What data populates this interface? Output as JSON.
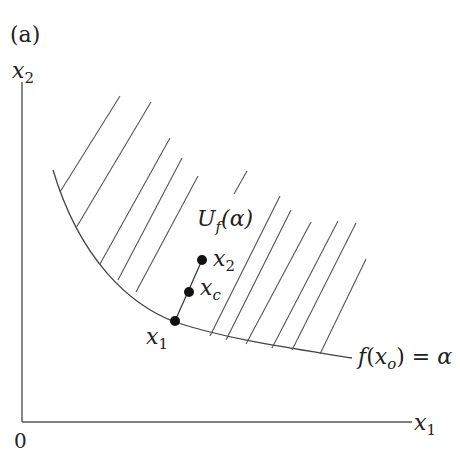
{
  "panel_label": "(a)",
  "axes": {
    "y_label_base": "x",
    "y_label_sub": "2",
    "x_label_base": "x",
    "x_label_sub": "1",
    "origin": "0"
  },
  "region_label": {
    "base": "U",
    "sub": "f",
    "arg": "(α)"
  },
  "curve_label": {
    "f": "f",
    "open": "(",
    "var": "x",
    "sub": "o",
    "close": ")",
    "eq": " = α"
  },
  "points": [
    {
      "id": "x1",
      "base": "x",
      "sub": "1"
    },
    {
      "id": "xc",
      "base": "x",
      "sub": "c"
    },
    {
      "id": "x2",
      "base": "x",
      "sub": "2"
    }
  ],
  "colors": {
    "line": "#555555",
    "point": "#111111",
    "text": "#222222"
  }
}
